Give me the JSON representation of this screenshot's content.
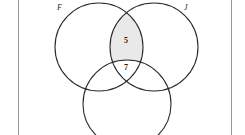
{
  "figure": {
    "type": "venn-diagram",
    "stroke_color": "#2b2b2b",
    "shade_color": "#e9e9e9",
    "background_color": "#ffffff",
    "border_rule_color": "#9a9a9a",
    "circles": [
      {
        "id": "F",
        "label": "F",
        "cx": 99,
        "cy": 47,
        "r": 44
      },
      {
        "id": "J",
        "label": "J",
        "cx": 154,
        "cy": 47,
        "r": 44
      },
      {
        "id": "K",
        "label": "",
        "cx": 127,
        "cy": 104,
        "r": 44
      }
    ],
    "labels": [
      {
        "name": "set-label-f",
        "text": "F",
        "x": 60,
        "y": 7
      },
      {
        "name": "set-label-j",
        "text": "J",
        "x": 187,
        "y": 7
      }
    ],
    "regions": [
      {
        "name": "f-and-j-only",
        "value": "5",
        "x": 126,
        "y": 41,
        "shaded": true
      },
      {
        "name": "all-three-sets",
        "value": "7",
        "x": 126,
        "y": 68,
        "shaded": false
      }
    ]
  }
}
